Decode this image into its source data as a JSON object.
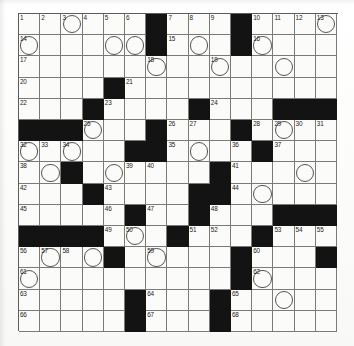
{
  "puzzle": {
    "type": "crossword-grid",
    "rows": 15,
    "cols": 15,
    "cell_px": 21.2,
    "colors": {
      "block": "#131313",
      "open": "#fbfbf9",
      "gridline": "#7a7a78",
      "number": "#1b1b1b",
      "circle_stroke": "#555553",
      "paper": "#fdfdfc"
    },
    "legend": {
      "black_square_meaning": "blocked-cell",
      "circled_square_meaning": "circled-letter-cell"
    },
    "counts": {
      "total_cells": 225,
      "black_cells": 51,
      "open_cells": 174,
      "numbered_cells": 68,
      "circled_cells": 32,
      "max_clue_number": 68
    },
    "grid": [
      "....#...#....",
      "",
      ""
    ],
    "blacks": [
      [
        1,
        7
      ],
      [
        1,
        11
      ],
      [
        2,
        7
      ],
      [
        2,
        11
      ],
      [
        4,
        5
      ],
      [
        5,
        4
      ],
      [
        5,
        9
      ],
      [
        5,
        13
      ],
      [
        5,
        14
      ],
      [
        5,
        15
      ],
      [
        6,
        1
      ],
      [
        6,
        2
      ],
      [
        6,
        3
      ],
      [
        6,
        7
      ],
      [
        6,
        11
      ],
      [
        7,
        6
      ],
      [
        7,
        7
      ],
      [
        7,
        12
      ],
      [
        8,
        3
      ],
      [
        8,
        10
      ],
      [
        9,
        4
      ],
      [
        9,
        9
      ],
      [
        9,
        10
      ],
      [
        10,
        6
      ],
      [
        10,
        9
      ],
      [
        10,
        13
      ],
      [
        10,
        14
      ],
      [
        10,
        15
      ],
      [
        11,
        1
      ],
      [
        11,
        2
      ],
      [
        11,
        3
      ],
      [
        11,
        4
      ],
      [
        11,
        8
      ],
      [
        11,
        12
      ],
      [
        12,
        5
      ],
      [
        12,
        11
      ],
      [
        12,
        15
      ],
      [
        13,
        11
      ],
      [
        14,
        6
      ],
      [
        14,
        10
      ],
      [
        15,
        6
      ],
      [
        15,
        10
      ]
    ],
    "circles": [
      [
        1,
        3
      ],
      [
        1,
        15
      ],
      [
        2,
        1
      ],
      [
        2,
        5
      ],
      [
        2,
        6
      ],
      [
        2,
        9
      ],
      [
        2,
        12
      ],
      [
        3,
        7
      ],
      [
        3,
        10
      ],
      [
        3,
        13
      ],
      [
        6,
        4
      ],
      [
        6,
        13
      ],
      [
        7,
        1
      ],
      [
        7,
        3
      ],
      [
        7,
        9
      ],
      [
        8,
        2
      ],
      [
        8,
        5
      ],
      [
        8,
        14
      ],
      [
        9,
        12
      ],
      [
        11,
        6
      ],
      [
        12,
        2
      ],
      [
        12,
        4
      ],
      [
        12,
        7
      ],
      [
        13,
        1
      ],
      [
        13,
        12
      ],
      [
        14,
        13
      ]
    ],
    "numbers": [
      {
        "n": 1,
        "row": 1,
        "col": 1
      },
      {
        "n": 2,
        "row": 1,
        "col": 2
      },
      {
        "n": 3,
        "row": 1,
        "col": 3
      },
      {
        "n": 4,
        "row": 1,
        "col": 4
      },
      {
        "n": 5,
        "row": 1,
        "col": 5
      },
      {
        "n": 6,
        "row": 1,
        "col": 6
      },
      {
        "n": 7,
        "row": 1,
        "col": 8
      },
      {
        "n": 8,
        "row": 1,
        "col": 9
      },
      {
        "n": 9,
        "row": 1,
        "col": 10
      },
      {
        "n": 10,
        "row": 1,
        "col": 12
      },
      {
        "n": 11,
        "row": 1,
        "col": 13
      },
      {
        "n": 12,
        "row": 1,
        "col": 14
      },
      {
        "n": 13,
        "row": 1,
        "col": 15
      },
      {
        "n": 14,
        "row": 2,
        "col": 1
      },
      {
        "n": 15,
        "row": 2,
        "col": 8
      },
      {
        "n": 16,
        "row": 2,
        "col": 12
      },
      {
        "n": 17,
        "row": 3,
        "col": 1
      },
      {
        "n": 18,
        "row": 3,
        "col": 7
      },
      {
        "n": 19,
        "row": 3,
        "col": 10
      },
      {
        "n": 20,
        "row": 4,
        "col": 1
      },
      {
        "n": 21,
        "row": 4,
        "col": 6
      },
      {
        "n": 22,
        "row": 5,
        "col": 1
      },
      {
        "n": 23,
        "row": 5,
        "col": 5
      },
      {
        "n": 24,
        "row": 5,
        "col": 10
      },
      {
        "n": 25,
        "row": 6,
        "col": 4
      },
      {
        "n": 26,
        "row": 6,
        "col": 8
      },
      {
        "n": 27,
        "row": 6,
        "col": 9
      },
      {
        "n": 28,
        "row": 6,
        "col": 12
      },
      {
        "n": 29,
        "row": 6,
        "col": 13
      },
      {
        "n": 30,
        "row": 6,
        "col": 14
      },
      {
        "n": 31,
        "row": 6,
        "col": 15
      },
      {
        "n": 32,
        "row": 7,
        "col": 1
      },
      {
        "n": 33,
        "row": 7,
        "col": 2
      },
      {
        "n": 34,
        "row": 7,
        "col": 3
      },
      {
        "n": 35,
        "row": 7,
        "col": 8
      },
      {
        "n": 36,
        "row": 7,
        "col": 11
      },
      {
        "n": 37,
        "row": 7,
        "col": 13
      },
      {
        "n": 38,
        "row": 8,
        "col": 1
      },
      {
        "n": 39,
        "row": 8,
        "col": 6
      },
      {
        "n": 40,
        "row": 8,
        "col": 7
      },
      {
        "n": 41,
        "row": 8,
        "col": 11
      },
      {
        "n": 42,
        "row": 9,
        "col": 1
      },
      {
        "n": 43,
        "row": 9,
        "col": 5
      },
      {
        "n": 44,
        "row": 9,
        "col": 11
      },
      {
        "n": 45,
        "row": 10,
        "col": 1
      },
      {
        "n": 46,
        "row": 10,
        "col": 5
      },
      {
        "n": 47,
        "row": 10,
        "col": 7
      },
      {
        "n": 48,
        "row": 10,
        "col": 10
      },
      {
        "n": 49,
        "row": 11,
        "col": 5
      },
      {
        "n": 50,
        "row": 11,
        "col": 6
      },
      {
        "n": 51,
        "row": 11,
        "col": 9
      },
      {
        "n": 52,
        "row": 11,
        "col": 10
      },
      {
        "n": 53,
        "row": 11,
        "col": 13
      },
      {
        "n": 54,
        "row": 11,
        "col": 14
      },
      {
        "n": 55,
        "row": 11,
        "col": 15
      },
      {
        "n": 56,
        "row": 12,
        "col": 1
      },
      {
        "n": 57,
        "row": 12,
        "col": 2
      },
      {
        "n": 58,
        "row": 12,
        "col": 3
      },
      {
        "n": 59,
        "row": 12,
        "col": 7
      },
      {
        "n": 60,
        "row": 12,
        "col": 12
      },
      {
        "n": 61,
        "row": 13,
        "col": 1
      },
      {
        "n": 62,
        "row": 13,
        "col": 12
      },
      {
        "n": 63,
        "row": 14,
        "col": 1
      },
      {
        "n": 64,
        "row": 14,
        "col": 7
      },
      {
        "n": 65,
        "row": 14,
        "col": 11
      },
      {
        "n": 66,
        "row": 15,
        "col": 1
      },
      {
        "n": 67,
        "row": 15,
        "col": 7
      },
      {
        "n": 68,
        "row": 15,
        "col": 11
      }
    ]
  }
}
